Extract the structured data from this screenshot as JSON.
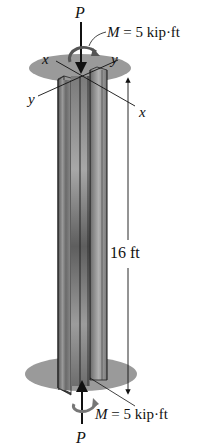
{
  "diagram": {
    "type": "structural-column",
    "labels": {
      "top_force": "P",
      "bottom_force": "P",
      "top_moment": "M = 5 kip·ft",
      "bottom_moment": "M = 5 kip·ft",
      "length": "16 ft",
      "axis_x_top_left": "x",
      "axis_y_top_right": "y",
      "axis_y_left": "y",
      "axis_x_right": "x"
    },
    "colors": {
      "ellipse": "#9a9a9a",
      "column_dark": "#4a4a4a",
      "column_light": "#bdbdbd",
      "line": "#111111"
    }
  }
}
